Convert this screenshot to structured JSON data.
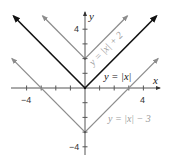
{
  "chart_data": {
    "type": "line",
    "title": "",
    "xlabel": "x",
    "ylabel": "y",
    "xlim": [
      -5,
      5
    ],
    "ylim": [
      -4.5,
      5
    ],
    "x_ticks": [
      -4,
      -3,
      -2,
      -1,
      1,
      2,
      3,
      4
    ],
    "y_ticks": [
      -4,
      -3,
      -2,
      -1,
      1,
      2,
      3,
      4
    ],
    "x_tick_labels": [
      {
        "value": -4,
        "label": "−4"
      },
      {
        "value": 4,
        "label": "4"
      }
    ],
    "y_tick_labels": [
      {
        "value": 4,
        "label": "4"
      },
      {
        "value": -4,
        "label": "−4"
      }
    ],
    "grid": false,
    "series": [
      {
        "name": "y = |x|",
        "label": "y = |x|",
        "color": "#111111",
        "width": 1.6,
        "points": [
          [
            -4.9,
            4.9
          ],
          [
            0,
            0
          ],
          [
            4.9,
            4.9
          ]
        ],
        "arrows": true
      },
      {
        "name": "y = |x| + 2",
        "label": "y = |x| + 2",
        "color": "#8c8c8c",
        "width": 1.3,
        "points": [
          [
            -2.9,
            4.9
          ],
          [
            0,
            2
          ],
          [
            2.9,
            4.9
          ]
        ],
        "arrows": true
      },
      {
        "name": "y = |x| − 3",
        "label": "y = |x| − 3",
        "color": "#8c8c8c",
        "width": 1.3,
        "points": [
          [
            -5.0,
            2.0
          ],
          [
            0,
            -3
          ],
          [
            5.0,
            2.0
          ]
        ],
        "arrows": true
      }
    ]
  },
  "labels": {
    "x_axis": "x",
    "y_axis": "y",
    "x_tick_neg4": "−4",
    "x_tick_4": "4",
    "y_tick_4": "4",
    "y_tick_neg4": "−4",
    "eq_abs": "y = |x|",
    "eq_plus2": "y = |x| + 2",
    "eq_minus3": "y = |x| − 3"
  }
}
